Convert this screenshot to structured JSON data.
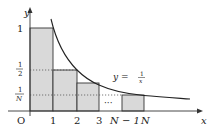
{
  "figure": {
    "colors": {
      "background": "#ffffff",
      "bar_fill": "#d9d9d9",
      "stroke": "#333333",
      "dotted": "#555555"
    },
    "axes": {
      "x_label": "x",
      "y_label": "y",
      "origin_label": "O"
    },
    "x_ticks": [
      "1",
      "2",
      "3",
      "N − 1",
      "N"
    ],
    "y_ticks": {
      "one": "1",
      "half_num": "1",
      "half_den": "2",
      "invN_num": "1",
      "invN_den": "N"
    },
    "curve_label": {
      "lhs": "y =",
      "num": "1",
      "den": "x"
    },
    "ellipsis": "···",
    "rectangles": [
      {
        "from": "0",
        "to": "1",
        "height": "1"
      },
      {
        "from": "1",
        "to": "2",
        "height": "1/2"
      },
      {
        "from": "2",
        "to": "3",
        "height": "1/3"
      },
      {
        "from": "N−1",
        "to": "N",
        "height": "1/N"
      }
    ]
  }
}
